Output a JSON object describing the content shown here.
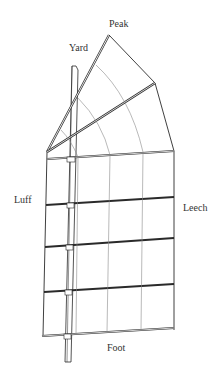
{
  "labels": {
    "peak": "Peak",
    "yard": "Yard",
    "luff": "Luff",
    "leech": "Leech",
    "foot": "Foot"
  },
  "colors": {
    "line": "#2a2a2a",
    "thin_line": "#8a8a8a",
    "background": "#ffffff"
  }
}
